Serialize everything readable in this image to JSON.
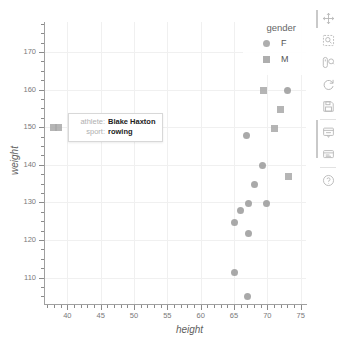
{
  "chart_data": {
    "type": "scatter",
    "title": "",
    "xlabel": "height",
    "ylabel": "weight",
    "xlim": [
      36.5,
      75.8
    ],
    "ylim": [
      103,
      178
    ],
    "grid": true,
    "legend": {
      "position": "top-right",
      "title": "gender",
      "entries": [
        {
          "label": "F",
          "marker": "circle"
        },
        {
          "label": "M",
          "marker": "square"
        }
      ]
    },
    "xticks": [
      40,
      45,
      50,
      55,
      60,
      65,
      70,
      75
    ],
    "yticks": [
      110,
      120,
      130,
      140,
      150,
      160,
      170
    ],
    "series": [
      {
        "name": "F",
        "marker": "circle",
        "points": [
          {
            "x": 73.0,
            "y": 159.8
          },
          {
            "x": 66.8,
            "y": 147.9
          },
          {
            "x": 69.3,
            "y": 139.8
          },
          {
            "x": 68.0,
            "y": 134.9
          },
          {
            "x": 69.8,
            "y": 129.8
          },
          {
            "x": 67.1,
            "y": 129.8
          },
          {
            "x": 66.0,
            "y": 127.8
          },
          {
            "x": 65.0,
            "y": 124.8
          },
          {
            "x": 67.1,
            "y": 121.8
          },
          {
            "x": 65.0,
            "y": 111.5
          },
          {
            "x": 67.0,
            "y": 105.0
          }
        ]
      },
      {
        "name": "M",
        "marker": "square",
        "points": [
          {
            "x": 69.4,
            "y": 159.8
          },
          {
            "x": 72.0,
            "y": 154.8
          },
          {
            "x": 71.0,
            "y": 149.8
          },
          {
            "x": 73.2,
            "y": 136.8
          },
          {
            "x": 37.9,
            "y": 150.0
          },
          {
            "x": 38.6,
            "y": 150.0
          }
        ]
      }
    ]
  },
  "tooltip": {
    "rows": [
      {
        "key": "athlete:",
        "value": "Blake Haxton"
      },
      {
        "key": "sport:",
        "value": "rowing"
      }
    ]
  },
  "toolbar": {
    "buttons": [
      {
        "name": "pan-tool",
        "icon": "move-icon"
      },
      {
        "name": "box-zoom-tool",
        "icon": "zoom-box-icon"
      },
      {
        "name": "wheel-zoom-tool",
        "icon": "zoom-wheel-icon"
      },
      {
        "name": "reset-tool",
        "icon": "reset-icon"
      },
      {
        "name": "save-tool",
        "icon": "save-icon"
      },
      {
        "name": "hover-tool",
        "icon": "hover-icon"
      },
      {
        "name": "inspect-tool",
        "icon": "inspect-icon"
      },
      {
        "name": "help-tool",
        "icon": "help-icon"
      }
    ]
  },
  "colors": {
    "marker": "#9a9a9a",
    "grid": "#f0f0f0",
    "axis": "#a0a0a0",
    "text": "#7a7a7a",
    "toolbar_icon": "#b6b6b6"
  }
}
